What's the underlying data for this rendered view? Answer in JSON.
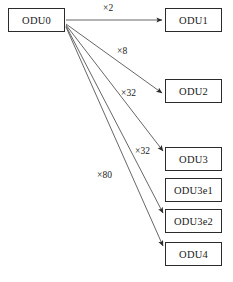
{
  "diagram": {
    "stroke_color": "#555555",
    "box_border_color": "#2b2b2b",
    "text_color": "#1a1a1a",
    "background": "#ffffff",
    "nodes": [
      {
        "id": "odu0",
        "label": "ODU0",
        "x": 8,
        "y": 8,
        "w": 57,
        "h": 24
      },
      {
        "id": "odu1",
        "label": "ODU1",
        "x": 165,
        "y": 8,
        "w": 57,
        "h": 24
      },
      {
        "id": "odu2",
        "label": "ODU2",
        "x": 165,
        "y": 79,
        "w": 57,
        "h": 24
      },
      {
        "id": "odu3",
        "label": "ODU3",
        "x": 165,
        "y": 147,
        "w": 57,
        "h": 24
      },
      {
        "id": "odu3e1",
        "label": "ODU3e1",
        "x": 165,
        "y": 178,
        "w": 57,
        "h": 24
      },
      {
        "id": "odu3e2",
        "label": "ODU3e2",
        "x": 165,
        "y": 209,
        "w": 57,
        "h": 24
      },
      {
        "id": "odu4",
        "label": "ODU4",
        "x": 165,
        "y": 242,
        "w": 57,
        "h": 24
      }
    ],
    "edges": [
      {
        "id": "e-odu1",
        "from": "odu0",
        "to": "odu1",
        "label": "×2",
        "x1": 66,
        "y1": 20,
        "x2": 162,
        "y2": 20,
        "label_x": 103,
        "label_y": 3
      },
      {
        "id": "e-odu2",
        "from": "odu0",
        "to": "odu2",
        "label": "×8",
        "x1": 66,
        "y1": 24,
        "x2": 162,
        "y2": 93,
        "label_x": 117,
        "label_y": 46
      },
      {
        "id": "e-odu3",
        "from": "odu0",
        "to": "odu3",
        "label": "×32",
        "x1": 66,
        "y1": 25,
        "x2": 163,
        "y2": 151,
        "label_x": 121,
        "label_y": 88
      },
      {
        "id": "e-odu3e2",
        "from": "odu0",
        "to": "odu3e2",
        "label": "×32",
        "x1": 66,
        "y1": 26,
        "x2": 163,
        "y2": 213,
        "label_x": 135,
        "label_y": 146
      },
      {
        "id": "e-odu4",
        "from": "odu0",
        "to": "odu4",
        "label": "×80",
        "x1": 66,
        "y1": 27,
        "x2": 163,
        "y2": 246,
        "label_x": 97,
        "label_y": 170
      }
    ]
  }
}
